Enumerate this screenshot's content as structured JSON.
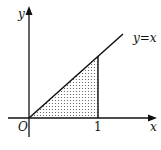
{
  "diagram": {
    "type": "function-graph",
    "axes": {
      "x_label": "x",
      "y_label": "y",
      "origin_label": "O"
    },
    "curve": {
      "label": "y=x",
      "equation": "y = x"
    },
    "tick": {
      "x_value_label": "1"
    },
    "shaded_region": {
      "description": "triangle bounded by y=x, x-axis, and x=1",
      "fill": "dotted"
    },
    "colors": {
      "stroke": "#111111",
      "background": "#ffffff",
      "dots": "#555555"
    }
  }
}
